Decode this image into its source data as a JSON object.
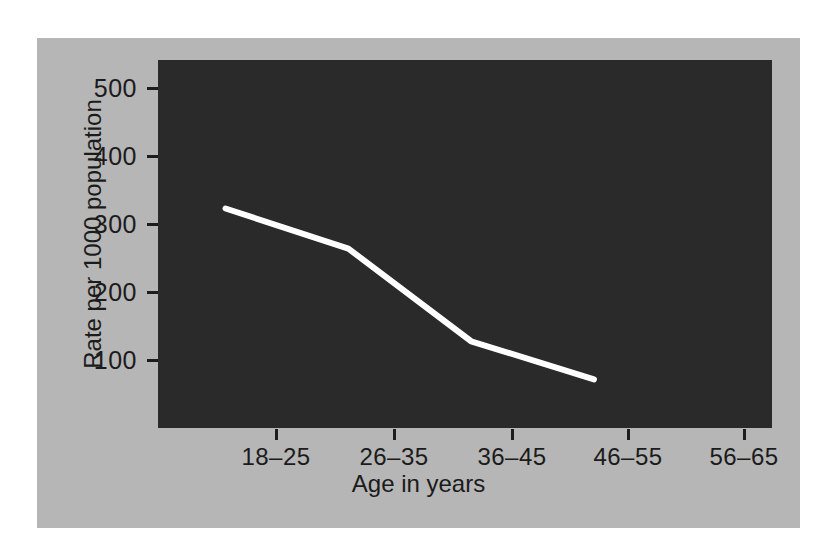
{
  "chart_data": {
    "type": "line",
    "title": "",
    "xlabel": "Age in years",
    "ylabel": "Rate per 1000 population",
    "categories": [
      "18–25",
      "26–35",
      "36–45",
      "46–55",
      "56–65"
    ],
    "values": [
      334,
      273,
      132,
      74,
      null
    ],
    "series": [
      {
        "name": "Rate per 1000 population",
        "values": [
          334,
          273,
          132,
          74,
          null
        ],
        "color": "#ffffff",
        "line_width": 6
      }
    ],
    "yticks": [
      100,
      200,
      300,
      400,
      500
    ],
    "ytick_labels": [
      "100",
      "200",
      "300",
      "400",
      "500"
    ],
    "xtick_labels": [
      "18–25",
      "26–35",
      "36–45",
      "46–55",
      "56–65"
    ],
    "ylim": [
      0,
      560
    ],
    "xlim": [
      -0.55,
      4.45
    ],
    "grid": false,
    "legend": false,
    "legend_position": "none",
    "plot_background": "#2a2a2a",
    "figure_background": "#b6b6b6",
    "page_background": "#ffffff",
    "axis_color": "#1d1d1d",
    "text_color": "#1b1b1b",
    "annotations": []
  }
}
